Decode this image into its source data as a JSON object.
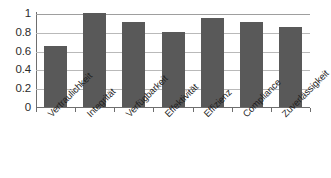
{
  "chart_data": {
    "type": "bar",
    "title": "",
    "xlabel": "",
    "ylabel": "",
    "categories": [
      "Vertraulichkeit",
      "Integrität",
      "Verfügbarkeit",
      "Effektivität",
      "Effizienz",
      "Compliance",
      "Zuverlässigkeit"
    ],
    "values": [
      0.65,
      1.0,
      0.9,
      0.8,
      0.95,
      0.9,
      0.85
    ],
    "ylim": [
      0,
      1
    ],
    "yticks": [
      0,
      0.2,
      0.4,
      0.6,
      0.8,
      1
    ],
    "ytick_labels": [
      "0",
      "0.2",
      "0.4",
      "0.6",
      "0.8",
      "1"
    ],
    "grid": true,
    "legend": false,
    "bar_color": "#595959",
    "grid_color": "#b9b9b9",
    "axis_color": "#6e6e6e",
    "background": "#ffffff"
  }
}
